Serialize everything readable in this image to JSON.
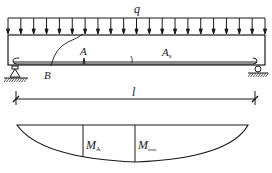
{
  "diagram": {
    "type": "simply-supported beam with uniform load and bending moment diagram",
    "load": {
      "label": "q",
      "arrow_count": 21,
      "direction": "down"
    },
    "beam": {
      "points": {
        "A": "A",
        "B": "B"
      },
      "rebar_area_label": {
        "main": "A",
        "sub": "s"
      },
      "supports": [
        "pin",
        "roller"
      ]
    },
    "dimension": {
      "label": "l"
    },
    "moment_diagram": {
      "labels": [
        {
          "main": "M",
          "sub": "A"
        },
        {
          "main": "M",
          "sub": "max"
        }
      ]
    },
    "colors": {
      "stroke": "#1a1a1a",
      "background": "#ffffff"
    }
  }
}
